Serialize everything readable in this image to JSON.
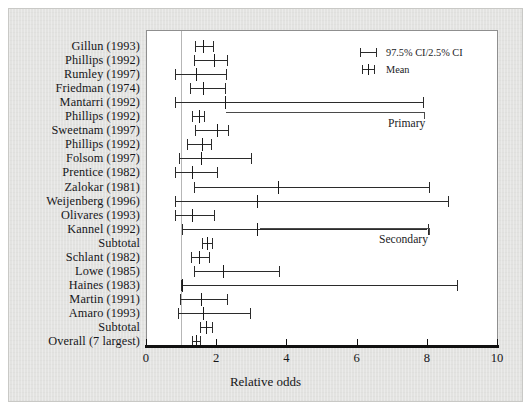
{
  "chart_data": {
    "type": "scatter",
    "title": "",
    "xlabel": "Relative odds",
    "ylabel": "",
    "xlim": [
      0,
      10
    ],
    "xticks": [
      0,
      2,
      4,
      6,
      8,
      10
    ],
    "xtick_labels": [
      "0",
      "2",
      "4",
      "6",
      "8",
      "10"
    ],
    "grid": false,
    "reference_line": 1.0,
    "legend_position": "top-right",
    "legend": [
      {
        "glyph": "ci-bar",
        "label": "97.5% CI/2.5% CI"
      },
      {
        "glyph": "mean-tick",
        "label": "Mean"
      }
    ],
    "groups": [
      {
        "name": "Primary",
        "label": "Primary",
        "first_row": 0,
        "last_row": 13
      },
      {
        "name": "Secondary",
        "label": "Secondary",
        "first_row": 15,
        "last_row": 19
      }
    ],
    "categories": [
      "Gillun (1993)",
      "Phillips (1992)",
      "Rumley (1997)",
      "Friedman (1974)",
      "Mantarri (1992)",
      "Phillips (1992)",
      "Sweetnam (1997)",
      "Phillips (1992)",
      "Folsom (1997)",
      "Prentice (1982)",
      "Zalokar (1981)",
      "Weijenberg (1996)",
      "Olivares (1993)",
      "Kannel (1992)",
      "Subtotal",
      "Schlant (1982)",
      "Lowe (1985)",
      "Haines (1983)",
      "Martin (1991)",
      "Amaro (1993)",
      "Subtotal",
      "Overall (7 largest)"
    ],
    "points": [
      {
        "label": "Gillun (1993)",
        "mean": 1.62,
        "low": 1.4,
        "high": 1.91
      },
      {
        "label": "Phillips (1992)",
        "mean": 1.93,
        "low": 1.37,
        "high": 2.32
      },
      {
        "label": "Rumley (1997)",
        "mean": 1.42,
        "low": 0.83,
        "high": 2.28
      },
      {
        "label": "Friedman (1974)",
        "mean": 1.62,
        "low": 1.25,
        "high": 2.25
      },
      {
        "label": "Mantarri (1992)",
        "mean": 2.25,
        "low": 0.83,
        "high": 7.9
      },
      {
        "label": "Phillips (1992)",
        "mean": 1.52,
        "low": 1.32,
        "high": 1.65
      },
      {
        "label": "Sweetnam (1997)",
        "mean": 2.02,
        "low": 1.4,
        "high": 2.35
      },
      {
        "label": "Phillips (1992)",
        "mean": 1.6,
        "low": 1.18,
        "high": 1.85
      },
      {
        "label": "Folsom (1997)",
        "mean": 1.58,
        "low": 0.95,
        "high": 3.0
      },
      {
        "label": "Prentice (1982)",
        "mean": 1.3,
        "low": 0.84,
        "high": 2.02
      },
      {
        "label": "Zalokar (1981)",
        "mean": 3.75,
        "low": 1.38,
        "high": 8.05
      },
      {
        "label": "Weijenberg (1996)",
        "mean": 3.15,
        "low": 0.83,
        "high": 8.6
      },
      {
        "label": "Olivares (1993)",
        "mean": 1.3,
        "low": 0.82,
        "high": 1.95
      },
      {
        "label": "Kannel (1992)",
        "mean": 3.15,
        "low": 1.02,
        "high": 8.02
      },
      {
        "label": "Subtotal",
        "mean": 1.75,
        "low": 1.6,
        "high": 1.88
      },
      {
        "label": "Schlant (1982)",
        "mean": 1.5,
        "low": 1.28,
        "high": 1.8
      },
      {
        "label": "Lowe (1985)",
        "mean": 2.2,
        "low": 1.38,
        "high": 3.8
      },
      {
        "label": "Haines (1983)",
        "mean": 1.02,
        "low": 1.0,
        "high": 8.85
      },
      {
        "label": "Martin (1991)",
        "mean": 1.58,
        "low": 0.96,
        "high": 2.3
      },
      {
        "label": "Amaro (1993)",
        "mean": 1.62,
        "low": 0.9,
        "high": 2.95
      },
      {
        "label": "Subtotal",
        "mean": 1.7,
        "low": 1.55,
        "high": 1.88
      },
      {
        "label": "Overall (7 largest)",
        "mean": 1.42,
        "low": 1.3,
        "high": 1.55
      }
    ]
  }
}
